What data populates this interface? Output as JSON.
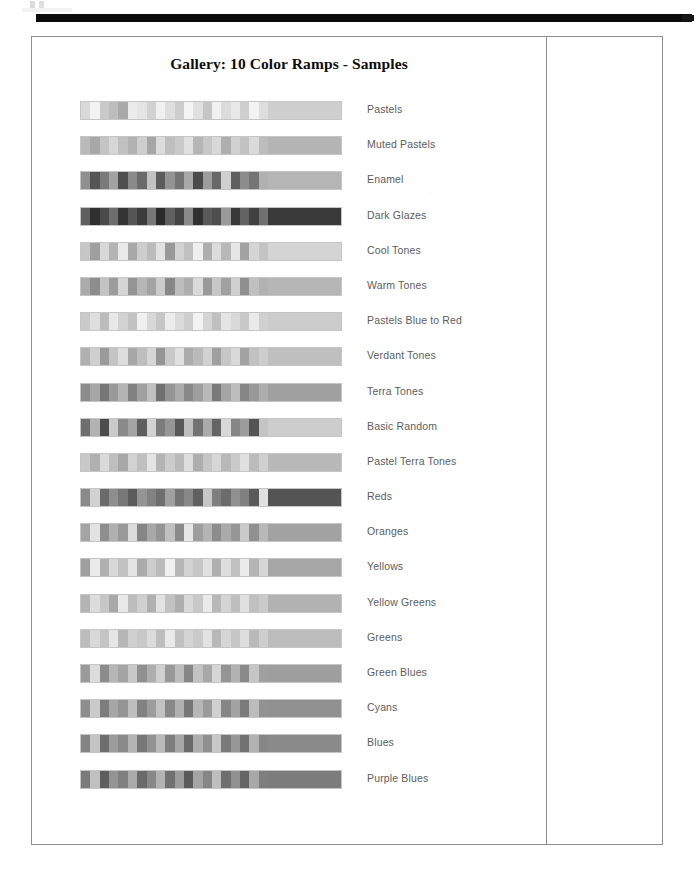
{
  "document": {
    "title": "Gallery: 10 Color Ramps - Samples",
    "top_rule": "black-horizontal-rule",
    "render_mode": "grayscale-scan"
  },
  "colors": {
    "page_background": "#ffffff",
    "border": "#8e8e8e",
    "rule": "#0b0b0b",
    "title_text": "#0d0d0d",
    "label_text": "#5d5d5d"
  },
  "ramps": [
    {
      "label": "Pastels",
      "bands": [
        "#d9d9d9",
        "#f2f2f2",
        "#c9c9c9",
        "#bdbdbd",
        "#a9a9a9",
        "#ececec",
        "#e4e4e4",
        "#d2d2d2",
        "#f0f0f0",
        "#dedede",
        "#cdcdcd",
        "#f4f4f4",
        "#e0e0e0",
        "#c6c6c6",
        "#f1f1f1",
        "#dbdbdb",
        "#e8e8e8",
        "#cfcfcf",
        "#f3f3f3",
        "#dddddd"
      ],
      "tail": "#cfcfcf"
    },
    {
      "label": "Muted Pastels",
      "bands": [
        "#b9b9b9",
        "#a8a8a8",
        "#c4c4c4",
        "#d6d6d6",
        "#c0c0c0",
        "#b2b2b2",
        "#cecece",
        "#a6a6a6",
        "#dcdcdc",
        "#bfbfbf",
        "#cacaca",
        "#e0e0e0",
        "#b5b5b5",
        "#c8c8c8",
        "#d9d9d9",
        "#aeaeae",
        "#d1d1d1",
        "#c2c2c2",
        "#dadada",
        "#bcbcbc"
      ],
      "tail": "#b4b4b4"
    },
    {
      "label": "Enamel",
      "bands": [
        "#8f8f8f",
        "#555555",
        "#7a7a7a",
        "#a2a2a2",
        "#4e4e4e",
        "#8a8a8a",
        "#6a6a6a",
        "#c2c2c2",
        "#5c5c5c",
        "#949494",
        "#747474",
        "#a8a8a8",
        "#4a4a4a",
        "#9d9d9d",
        "#686868",
        "#d0d0d0",
        "#5f5f5f",
        "#8c8c8c",
        "#757575",
        "#b0b0b0"
      ],
      "tail": "#b5b5b5"
    },
    {
      "label": "Dark Glazes",
      "bands": [
        "#5e5e5e",
        "#2f2f2f",
        "#4a4a4a",
        "#6e6e6e",
        "#343434",
        "#565656",
        "#3c3c3c",
        "#787878",
        "#2b2b2b",
        "#606060",
        "#444444",
        "#8a8a8a",
        "#303030",
        "#5a5a5a",
        "#4e4e4e",
        "#9a9a9a",
        "#383838",
        "#636363",
        "#414141",
        "#707070"
      ],
      "tail": "#3a3a3a"
    },
    {
      "label": "Cool Tones",
      "bands": [
        "#c7c7c7",
        "#9f9f9f",
        "#d8d8d8",
        "#b4b4b4",
        "#eaeaea",
        "#a8a8a8",
        "#cdcdcd",
        "#bbbbbb",
        "#e2e2e2",
        "#999999",
        "#d2d2d2",
        "#c0c0c0",
        "#efefef",
        "#aeaeae",
        "#dcdcdc",
        "#b8b8b8",
        "#e6e6e6",
        "#a3a3a3",
        "#d5d5d5",
        "#c4c4c4"
      ],
      "tail": "#d4d4d4"
    },
    {
      "label": "Warm Tones",
      "bands": [
        "#ababab",
        "#8d8d8d",
        "#c3c3c3",
        "#9c9c9c",
        "#d5d5d5",
        "#949494",
        "#b6b6b6",
        "#a4a4a4",
        "#cbcbcb",
        "#878787",
        "#bdbdbd",
        "#aeaeae",
        "#dadada",
        "#999999",
        "#c7c7c7",
        "#a0a0a0",
        "#d0d0d0",
        "#8f8f8f",
        "#c0c0c0",
        "#b2b2b2"
      ],
      "tail": "#b6b6b6"
    },
    {
      "label": "Pastels Blue to Red",
      "bands": [
        "#cacaca",
        "#dedede",
        "#bcbcbc",
        "#e8e8e8",
        "#d2d2d2",
        "#c2c2c2",
        "#f0f0f0",
        "#d8d8d8",
        "#c6c6c6",
        "#ececec",
        "#dbdbdb",
        "#cecece",
        "#f2f2f2",
        "#d5d5d5",
        "#c0c0c0",
        "#e4e4e4",
        "#d9d9d9",
        "#c8c8c8",
        "#eaeaea",
        "#d0d0d0"
      ],
      "tail": "#cccccc"
    },
    {
      "label": "Verdant Tones",
      "bands": [
        "#b0b0b0",
        "#cfcfcf",
        "#9a9a9a",
        "#c4c4c4",
        "#dddddd",
        "#a6a6a6",
        "#bebebe",
        "#d6d6d6",
        "#959595",
        "#c9c9c9",
        "#e1e1e1",
        "#acacac",
        "#bababa",
        "#d1d1d1",
        "#9f9f9f",
        "#c6c6c6",
        "#d9d9d9",
        "#a2a2a2",
        "#c1c1c1",
        "#cdcdcd"
      ],
      "tail": "#bfbfbf"
    },
    {
      "label": "Terra Tones",
      "bands": [
        "#8c8c8c",
        "#a6a6a6",
        "#767676",
        "#9a9a9a",
        "#b4b4b4",
        "#828282",
        "#a0a0a0",
        "#c0c0c0",
        "#707070",
        "#949494",
        "#aaaaaa",
        "#888888",
        "#9e9e9e",
        "#b8b8b8",
        "#7a7a7a",
        "#a4a4a4",
        "#bcbcbc",
        "#858585",
        "#989898",
        "#aeaeae"
      ],
      "tail": "#a0a0a0"
    },
    {
      "label": "Basic Random",
      "bands": [
        "#6e6e6e",
        "#b2b2b2",
        "#4c4c4c",
        "#cacaca",
        "#8a8a8a",
        "#a4a4a4",
        "#5e5e5e",
        "#d2d2d2",
        "#7c7c7c",
        "#969696",
        "#585858",
        "#bebebe",
        "#727272",
        "#aaaaaa",
        "#646464",
        "#d8d8d8",
        "#868686",
        "#9c9c9c",
        "#545454",
        "#c4c4c4"
      ],
      "tail": "#cdcdcd"
    },
    {
      "label": "Pastel Terra Tones",
      "bands": [
        "#c8c8c8",
        "#b0b0b0",
        "#dadada",
        "#bebebe",
        "#a8a8a8",
        "#d2d2d2",
        "#c0c0c0",
        "#e4e4e4",
        "#b4b4b4",
        "#cccccc",
        "#bababa",
        "#dedede",
        "#aeaeae",
        "#c6c6c6",
        "#d6d6d6",
        "#b8b8b8",
        "#cacaca",
        "#e0e0e0",
        "#bcbcbc",
        "#d0d0d0"
      ],
      "tail": "#b9b9b9"
    },
    {
      "label": "Reds",
      "bands": [
        "#8a8a8a",
        "#d2d2d2",
        "#6a6a6a",
        "#8e8e8e",
        "#787878",
        "#5c5c5c",
        "#949494",
        "#828282",
        "#6e6e6e",
        "#a0a0a0",
        "#747474",
        "#888888",
        "#606060",
        "#c6c6c6",
        "#7e7e7e",
        "#6c6c6c",
        "#909090",
        "#808080",
        "#5a5a5a",
        "#e0e0e0"
      ],
      "tail": "#545454"
    },
    {
      "label": "Oranges",
      "bands": [
        "#a4a4a4",
        "#e2e2e2",
        "#8e8e8e",
        "#b0b0b0",
        "#9a9a9a",
        "#dcdcdc",
        "#868686",
        "#a8a8a8",
        "#949494",
        "#c0c0c0",
        "#8a8a8a",
        "#e6e6e6",
        "#9e9e9e",
        "#b4b4b4",
        "#8c8c8c",
        "#aaaaaa",
        "#969696",
        "#cacaca",
        "#909090",
        "#b8b8b8"
      ],
      "tail": "#a2a2a2"
    },
    {
      "label": "Yellows",
      "bands": [
        "#9e9e9e",
        "#eaeaea",
        "#b0b0b0",
        "#d8d8d8",
        "#c2c2c2",
        "#e4e4e4",
        "#aaaaaa",
        "#cccccc",
        "#bababa",
        "#f0f0f0",
        "#b6b6b6",
        "#d2d2d2",
        "#c6c6c6",
        "#e0e0e0",
        "#aeaeae",
        "#dedede",
        "#c0c0c0",
        "#ececec",
        "#b4b4b4",
        "#d6d6d6"
      ],
      "tail": "#a6a6a6"
    },
    {
      "label": "Yellow Greens",
      "bands": [
        "#b4b4b4",
        "#dcdcdc",
        "#c6c6c6",
        "#a8a8a8",
        "#e8e8e8",
        "#bcbcbc",
        "#d0d0d0",
        "#b0b0b0",
        "#e2e2e2",
        "#c2c2c2",
        "#aeaeae",
        "#d8d8d8",
        "#c8c8c8",
        "#eaeaea",
        "#b8b8b8",
        "#d4d4d4",
        "#bebebe",
        "#e0e0e0",
        "#c0c0c0",
        "#cacaca"
      ],
      "tail": "#b2b2b2"
    },
    {
      "label": "Greens",
      "bands": [
        "#bcbcbc",
        "#d8d8d8",
        "#c4c4c4",
        "#e6e6e6",
        "#b6b6b6",
        "#d0d0d0",
        "#c8c8c8",
        "#dcdcdc",
        "#bebebe",
        "#eaeaea",
        "#c0c0c0",
        "#d4d4d4",
        "#cacaca",
        "#e2e2e2",
        "#b8b8b8",
        "#d6d6d6",
        "#c6c6c6",
        "#dedede",
        "#bababa",
        "#cecece"
      ],
      "tail": "#bcbcbc"
    },
    {
      "label": "Green Blues",
      "bands": [
        "#9a9a9a",
        "#dcdcdc",
        "#8c8c8c",
        "#b6b6b6",
        "#a4a4a4",
        "#c8c8c8",
        "#909090",
        "#aeaeae",
        "#d0d0d0",
        "#989898",
        "#bcbcbc",
        "#868686",
        "#c2c2c2",
        "#a8a8a8",
        "#d6d6d6",
        "#949494",
        "#b2b2b2",
        "#8a8a8a",
        "#c6c6c6",
        "#a0a0a0"
      ],
      "tail": "#9e9e9e"
    },
    {
      "label": "Cyans",
      "bands": [
        "#8e8e8e",
        "#cacaca",
        "#7c7c7c",
        "#a6a6a6",
        "#949494",
        "#bebebe",
        "#828282",
        "#9c9c9c",
        "#c2c2c2",
        "#888888",
        "#b0b0b0",
        "#767676",
        "#b6b6b6",
        "#9a9a9a",
        "#d0d0d0",
        "#868686",
        "#a2a2a2",
        "#7a7a7a",
        "#bcbcbc",
        "#929292"
      ],
      "tail": "#909090"
    },
    {
      "label": "Blues",
      "bands": [
        "#848484",
        "#c4c4c4",
        "#6e6e6e",
        "#9c9c9c",
        "#8a8a8a",
        "#b4b4b4",
        "#787878",
        "#929292",
        "#bababa",
        "#7e7e7e",
        "#a6a6a6",
        "#6a6a6a",
        "#aeaeae",
        "#909090",
        "#c8c8c8",
        "#7a7a7a",
        "#989898",
        "#727272",
        "#b2b2b2",
        "#868686"
      ],
      "tail": "#8a8a8a"
    },
    {
      "label": "Purple Blues",
      "bands": [
        "#7a7a7a",
        "#c0c0c0",
        "#5e5e5e",
        "#949494",
        "#808080",
        "#aaaaaa",
        "#6a6a6a",
        "#888888",
        "#b2b2b2",
        "#707070",
        "#9c9c9c",
        "#5a5a5a",
        "#a4a4a4",
        "#868686",
        "#bebebe",
        "#6e6e6e",
        "#909090",
        "#646464",
        "#a8a8a8",
        "#7e7e7e"
      ],
      "tail": "#7c7c7c"
    }
  ],
  "side_panel": {
    "content": ""
  }
}
